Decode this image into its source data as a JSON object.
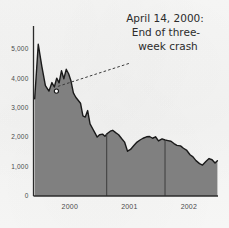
{
  "chart_data": {
    "type": "area",
    "title": "",
    "xlabel": "",
    "ylabel": "",
    "xlim": [
      1999.62,
      2002.72
    ],
    "ylim": [
      0,
      5600
    ],
    "grid": false,
    "legend": null,
    "x_tick_labels": [
      "2000",
      "2001",
      "2002"
    ],
    "x_tick_values": [
      2000.23,
      2001.23,
      2002.23
    ],
    "y_tick_labels": [
      "5,000",
      "4,000",
      "3,000",
      "2,000",
      "1,000",
      "0"
    ],
    "y_tick_values": [
      5000,
      4000,
      3000,
      2000,
      1000,
      0
    ],
    "year_divider_values": [
      2000.85,
      2001.83
    ],
    "series_name": "Index level",
    "x": [
      1999.64,
      1999.7,
      1999.76,
      1999.82,
      1999.88,
      1999.93,
      1999.97,
      2000.01,
      2000.05,
      2000.09,
      2000.13,
      2000.17,
      2000.21,
      2000.25,
      2000.29,
      2000.33,
      2000.37,
      2000.41,
      2000.45,
      2000.49,
      2000.53,
      2000.57,
      2000.61,
      2000.65,
      2000.69,
      2000.73,
      2000.78,
      2000.82,
      2000.86,
      2000.91,
      2000.95,
      2001.0,
      2001.05,
      2001.1,
      2001.15,
      2001.2,
      2001.25,
      2001.31,
      2001.36,
      2001.41,
      2001.46,
      2001.52,
      2001.57,
      2001.62,
      2001.67,
      2001.72,
      2001.78,
      2001.83,
      2001.88,
      2001.93,
      2001.98,
      2002.03,
      2002.09,
      2002.14,
      2002.19,
      2002.25,
      2002.3,
      2002.35,
      2002.41,
      2002.46,
      2002.52,
      2002.57,
      2002.62,
      2002.67,
      2002.71
    ],
    "values": [
      3300,
      5150,
      4400,
      3750,
      3560,
      3850,
      3700,
      4000,
      3840,
      4250,
      3980,
      4300,
      4150,
      3900,
      3500,
      3350,
      3250,
      3150,
      2720,
      2680,
      2900,
      2450,
      2300,
      2150,
      2000,
      2080,
      2100,
      2030,
      2120,
      2200,
      2230,
      2150,
      2080,
      1950,
      1830,
      1520,
      1580,
      1720,
      1830,
      1900,
      1960,
      2010,
      2020,
      1960,
      2010,
      1870,
      1940,
      1900,
      1880,
      1860,
      1780,
      1720,
      1700,
      1620,
      1560,
      1400,
      1330,
      1200,
      1100,
      1050,
      1180,
      1270,
      1230,
      1120,
      1200
    ],
    "marker_point": {
      "x": 2000.005,
      "y": 3560,
      "style": "open-circle"
    },
    "annotation": {
      "lines": [
        "April 14, 2000:",
        "End of three-",
        "week crash"
      ],
      "leader_from": {
        "x": 2000.03,
        "y": 3720
      },
      "leader_to": {
        "x": 2001.24,
        "y": 4510
      },
      "leader_style": "dashed"
    },
    "colors": {
      "area_fill": "#808080",
      "line": "#1a1a1a",
      "axis": "#2b2b2b",
      "divider": "#3c3c3c",
      "text": "#2b2b2b",
      "background": "#f6f6f5",
      "marker_fill": "#ffffff"
    }
  }
}
